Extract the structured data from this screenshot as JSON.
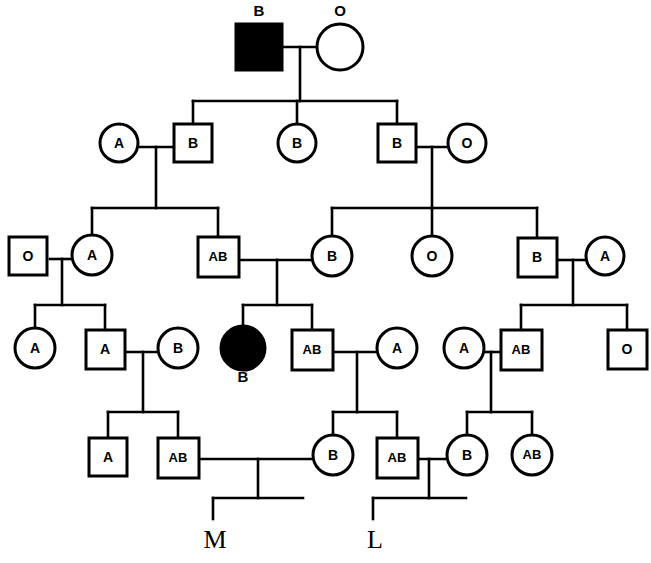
{
  "diagram": {
    "type": "pedigree-chart",
    "generations": 5,
    "colors": {
      "line": "#000000",
      "shape_stroke": "#000000",
      "shape_fill_open": "#ffffff",
      "shape_fill_affected": "#000000",
      "background": "#ffffff"
    },
    "legend_note": "Squares = male, circles = female, filled = affected"
  },
  "individuals": [
    {
      "id": "I-1",
      "shape": "square",
      "filled": true,
      "label": "B",
      "label_position": "above",
      "x": 259,
      "y": 47
    },
    {
      "id": "I-2",
      "shape": "circle",
      "filled": false,
      "label": "O",
      "label_position": "above",
      "x": 340,
      "y": 47
    },
    {
      "id": "II-1",
      "shape": "circle",
      "filled": false,
      "label": "A",
      "label_position": "inside",
      "x": 119,
      "y": 143
    },
    {
      "id": "II-2",
      "shape": "square",
      "filled": false,
      "label": "B",
      "label_position": "inside",
      "x": 193,
      "y": 143
    },
    {
      "id": "II-3",
      "shape": "circle",
      "filled": false,
      "label": "B",
      "label_position": "inside",
      "x": 297,
      "y": 143
    },
    {
      "id": "II-4",
      "shape": "square",
      "filled": false,
      "label": "B",
      "label_position": "inside",
      "x": 397,
      "y": 143
    },
    {
      "id": "II-5",
      "shape": "circle",
      "filled": false,
      "label": "O",
      "label_position": "inside",
      "x": 467,
      "y": 143
    },
    {
      "id": "III-1",
      "shape": "square",
      "filled": false,
      "label": "O",
      "label_position": "inside",
      "x": 28,
      "y": 255
    },
    {
      "id": "III-2",
      "shape": "circle",
      "filled": false,
      "label": "A",
      "label_position": "inside",
      "x": 92,
      "y": 255
    },
    {
      "id": "III-3",
      "shape": "square",
      "filled": false,
      "label": "AB",
      "label_position": "inside",
      "x": 218,
      "y": 256
    },
    {
      "id": "III-4",
      "shape": "circle",
      "filled": false,
      "label": "B",
      "label_position": "inside",
      "x": 332,
      "y": 256
    },
    {
      "id": "III-5",
      "shape": "circle",
      "filled": false,
      "label": "O",
      "label_position": "inside",
      "x": 432,
      "y": 256
    },
    {
      "id": "III-6",
      "shape": "square",
      "filled": false,
      "label": "B",
      "label_position": "inside",
      "x": 537,
      "y": 256
    },
    {
      "id": "III-7",
      "shape": "circle",
      "filled": false,
      "label": "A",
      "label_position": "inside",
      "x": 605,
      "y": 256
    },
    {
      "id": "IV-1",
      "shape": "circle",
      "filled": false,
      "label": "A",
      "label_position": "inside",
      "x": 35,
      "y": 348
    },
    {
      "id": "IV-2",
      "shape": "square",
      "filled": false,
      "label": "A",
      "label_position": "inside",
      "x": 105,
      "y": 348
    },
    {
      "id": "IV-3",
      "shape": "circle",
      "filled": false,
      "label": "B",
      "label_position": "inside",
      "x": 178,
      "y": 348
    },
    {
      "id": "IV-4",
      "shape": "circle",
      "filled": true,
      "label": "B",
      "label_position": "below",
      "x": 243,
      "y": 348
    },
    {
      "id": "IV-5",
      "shape": "square",
      "filled": false,
      "label": "AB",
      "label_position": "inside",
      "x": 312,
      "y": 348
    },
    {
      "id": "IV-6",
      "shape": "circle",
      "filled": false,
      "label": "A",
      "label_position": "inside",
      "x": 397,
      "y": 348
    },
    {
      "id": "IV-7",
      "shape": "circle",
      "filled": false,
      "label": "A",
      "label_position": "inside",
      "x": 464,
      "y": 348
    },
    {
      "id": "IV-8",
      "shape": "square",
      "filled": false,
      "label": "AB",
      "label_position": "inside",
      "x": 521,
      "y": 348
    },
    {
      "id": "IV-9",
      "shape": "square",
      "filled": false,
      "label": "O",
      "label_position": "inside",
      "x": 627,
      "y": 348
    },
    {
      "id": "V-1",
      "shape": "square",
      "filled": false,
      "label": "A",
      "label_position": "inside",
      "x": 108,
      "y": 455
    },
    {
      "id": "V-2",
      "shape": "square",
      "filled": false,
      "label": "AB",
      "label_position": "inside",
      "x": 178,
      "y": 455
    },
    {
      "id": "V-3",
      "shape": "circle",
      "filled": false,
      "label": "B",
      "label_position": "inside",
      "x": 333,
      "y": 455
    },
    {
      "id": "V-4",
      "shape": "square",
      "filled": false,
      "label": "AB",
      "label_position": "inside",
      "x": 397,
      "y": 455
    },
    {
      "id": "V-5",
      "shape": "circle",
      "filled": false,
      "label": "B",
      "label_position": "inside",
      "x": 467,
      "y": 455
    },
    {
      "id": "V-6",
      "shape": "circle",
      "filled": false,
      "label": "AB",
      "label_position": "inside",
      "x": 532,
      "y": 455
    }
  ],
  "offspring_markers": [
    {
      "id": "M",
      "label": "M",
      "x": 218,
      "y": 538
    },
    {
      "id": "L",
      "label": "L",
      "x": 378,
      "y": 538
    }
  ],
  "blood_types_present": [
    "A",
    "B",
    "AB",
    "O"
  ]
}
